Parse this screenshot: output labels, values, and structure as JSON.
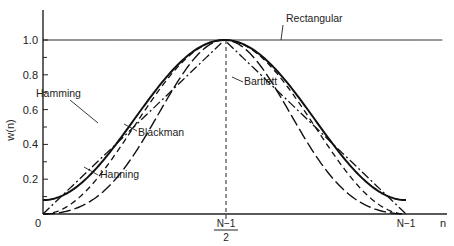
{
  "chart_data": {
    "type": "line",
    "title": "",
    "xlabel": "n",
    "ylabel": "w(n)",
    "ylim": [
      0,
      1.1
    ],
    "y_ticks": [
      "0",
      "0.2",
      "0.4",
      "0.6",
      "0.8",
      "1.0"
    ],
    "x_ticks": [
      {
        "pos": 0,
        "label": "0"
      },
      {
        "pos": 0.5,
        "label_num": "N−1",
        "label_den": "2"
      },
      {
        "pos": 1,
        "label": "N−1"
      }
    ],
    "grid": false,
    "x_normalized": "n/(N-1), 0 to 1",
    "series": [
      {
        "name": "Rectangular",
        "style": "solid-thin",
        "formula": "1",
        "x": [
          0,
          0.25,
          0.5,
          0.75,
          1
        ],
        "values": [
          1.0,
          1.0,
          1.0,
          1.0,
          1.0
        ]
      },
      {
        "name": "Hamming",
        "style": "solid-thick",
        "formula": "0.54-0.46cos(2πx)",
        "x": [
          0,
          0.1,
          0.2,
          0.3,
          0.4,
          0.5,
          0.6,
          0.7,
          0.8,
          0.9,
          1
        ],
        "values": [
          0.08,
          0.17,
          0.4,
          0.68,
          0.91,
          1.0,
          0.91,
          0.68,
          0.4,
          0.17,
          0.08
        ]
      },
      {
        "name": "Bartlett",
        "style": "dash-dot",
        "formula": "1-|2x-1|",
        "x": [
          0,
          0.25,
          0.5,
          0.75,
          1
        ],
        "values": [
          0,
          0.5,
          1.0,
          0.5,
          0
        ]
      },
      {
        "name": "Hanning",
        "style": "dashed",
        "formula": "0.5-0.5cos(2πx)",
        "x": [
          0,
          0.1,
          0.2,
          0.3,
          0.4,
          0.5,
          0.6,
          0.7,
          0.8,
          0.9,
          1
        ],
        "values": [
          0,
          0.1,
          0.35,
          0.65,
          0.9,
          1.0,
          0.9,
          0.65,
          0.35,
          0.1,
          0
        ]
      },
      {
        "name": "Blackman",
        "style": "long-dash",
        "formula": "0.42-0.5cos(2πx)+0.08cos(4πx)",
        "x": [
          0,
          0.1,
          0.2,
          0.3,
          0.4,
          0.5,
          0.6,
          0.7,
          0.8,
          0.9,
          1
        ],
        "values": [
          0,
          0.04,
          0.2,
          0.51,
          0.85,
          1.0,
          0.85,
          0.51,
          0.2,
          0.04,
          0
        ]
      }
    ],
    "annotations": [
      {
        "text": "Rectangular",
        "x": 286,
        "y": 22
      },
      {
        "text": "Bartlett",
        "x": 244,
        "y": 85
      },
      {
        "text": "Hamming",
        "x": 36,
        "y": 97
      },
      {
        "text": "Blackman",
        "x": 138,
        "y": 136
      },
      {
        "text": "Hanning",
        "x": 100,
        "y": 178
      }
    ]
  }
}
